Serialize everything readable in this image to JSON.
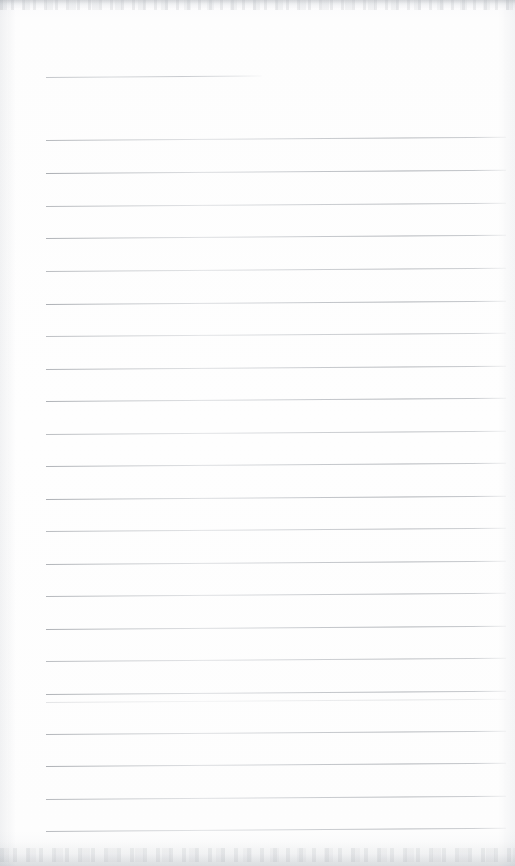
{
  "document": {
    "kind": "scanned-lined-notebook-page",
    "title": "",
    "body_text": "",
    "page_number": "",
    "content_note": "blank — no handwriting or printed text present",
    "width_px": 515,
    "height_px": 866
  },
  "appearance": {
    "paper_color": "#fdfdfd",
    "rule_color": "#9aa0a6",
    "edge_shadow_color": "#c4c7cb",
    "rule_count": 23,
    "rule_spacing_px": 32.5,
    "rule_left_px": 46,
    "rule_right_px": 506,
    "rule_slant_deg": -0.42
  },
  "ruled_lines": [
    {
      "id": "rule-1",
      "y": 77,
      "left": 46,
      "right": 262,
      "short": true,
      "opacity": 0.85
    },
    {
      "id": "rule-2",
      "y": 140,
      "left": 46,
      "right": 506,
      "short": false,
      "opacity": 0.82
    },
    {
      "id": "rule-3",
      "y": 173,
      "left": 46,
      "right": 506,
      "short": false,
      "opacity": 0.95
    },
    {
      "id": "rule-4",
      "y": 206,
      "left": 46,
      "right": 506,
      "short": false,
      "opacity": 0.8
    },
    {
      "id": "rule-5",
      "y": 238,
      "left": 46,
      "right": 506,
      "short": false,
      "opacity": 0.88
    },
    {
      "id": "rule-6",
      "y": 271,
      "left": 46,
      "right": 506,
      "short": false,
      "opacity": 0.78
    },
    {
      "id": "rule-7",
      "y": 304,
      "left": 46,
      "right": 506,
      "short": false,
      "opacity": 0.92
    },
    {
      "id": "rule-8",
      "y": 336,
      "left": 46,
      "right": 506,
      "short": false,
      "opacity": 0.74
    },
    {
      "id": "rule-9",
      "y": 369,
      "left": 46,
      "right": 506,
      "short": false,
      "opacity": 0.86
    },
    {
      "id": "rule-10",
      "y": 401,
      "left": 46,
      "right": 506,
      "short": false,
      "opacity": 0.9
    },
    {
      "id": "rule-11",
      "y": 434,
      "left": 46,
      "right": 506,
      "short": false,
      "opacity": 0.76
    },
    {
      "id": "rule-12",
      "y": 466,
      "left": 46,
      "right": 506,
      "short": false,
      "opacity": 0.88
    },
    {
      "id": "rule-13",
      "y": 499,
      "left": 46,
      "right": 506,
      "short": false,
      "opacity": 0.93
    },
    {
      "id": "rule-14",
      "y": 531,
      "left": 46,
      "right": 506,
      "short": false,
      "opacity": 0.79
    },
    {
      "id": "rule-15",
      "y": 564,
      "left": 46,
      "right": 506,
      "short": false,
      "opacity": 0.87
    },
    {
      "id": "rule-16",
      "y": 596,
      "left": 46,
      "right": 506,
      "short": false,
      "opacity": 0.83
    },
    {
      "id": "rule-17",
      "y": 629,
      "left": 46,
      "right": 506,
      "short": false,
      "opacity": 0.9
    },
    {
      "id": "rule-18",
      "y": 661,
      "left": 46,
      "right": 506,
      "short": false,
      "opacity": 0.77
    },
    {
      "id": "rule-19",
      "y": 694,
      "left": 46,
      "right": 506,
      "short": false,
      "opacity": 0.89
    },
    {
      "id": "rule-20",
      "y": 702,
      "left": 46,
      "right": 506,
      "short": false,
      "opacity": 0.3
    },
    {
      "id": "rule-21",
      "y": 734,
      "left": 46,
      "right": 506,
      "short": false,
      "opacity": 0.85
    },
    {
      "id": "rule-22",
      "y": 766,
      "left": 46,
      "right": 506,
      "short": false,
      "opacity": 0.91
    },
    {
      "id": "rule-23",
      "y": 799,
      "left": 46,
      "right": 506,
      "short": false,
      "opacity": 0.82
    },
    {
      "id": "rule-24",
      "y": 831,
      "left": 46,
      "right": 506,
      "short": false,
      "opacity": 0.8
    }
  ]
}
